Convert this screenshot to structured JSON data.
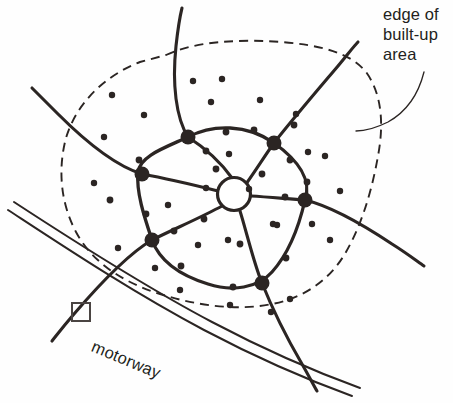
{
  "figure": {
    "type": "map-diagram",
    "background_color": "#fefefe",
    "ink_color": "#2b2523"
  },
  "labels": {
    "edge_of_builtup_area": {
      "name": "edge-of-built-up-area-label",
      "lines": [
        "edge of",
        "built-up",
        "area"
      ],
      "text": "edge of\nbuilt-up\narea",
      "x": 383,
      "y": 5,
      "font_size_px": 16.5,
      "leader_line": "curve from label down-left to the dashed boundary"
    },
    "motorway": {
      "name": "motorway-label",
      "text": "motorway",
      "x": 96,
      "y": 337,
      "rotation_deg": 22.5,
      "font_size_px": 16.5
    }
  },
  "features": {
    "built_up_area_boundary": {
      "name": "built-up-area-boundary",
      "style": "dashed",
      "dash_pattern": "9 6",
      "stroke_width": 1.9,
      "closed": true
    },
    "town_centre": {
      "name": "town-centre-ring",
      "shape": "circle",
      "cx": 234,
      "cy": 194,
      "r": 16.5,
      "fill": "#ffffff",
      "stroke_width": 3.2
    },
    "motorway": {
      "name": "motorway-road",
      "style": "double-line",
      "lines": 2,
      "stroke_width": 2.0,
      "separation_px": 9
    },
    "inner_ring_road": {
      "name": "inner-ring-road",
      "stroke_width": 3.3,
      "junction_count": 6
    },
    "radial_roads": {
      "name": "radial-roads",
      "count": 6,
      "stroke_width": 3.1
    },
    "symbol_square": {
      "name": "map-symbol-square",
      "x": 72,
      "y": 303,
      "size": 18,
      "stroke_width": 2.0
    }
  },
  "geometry": {
    "boundary_path": "M 166 55 C 196 41, 240 39, 282 42 C 318 45, 350 52, 366 72 C 382 94, 384 124, 378 156 C 372 190, 362 224, 346 252 C 330 280, 304 298, 272 304 C 238 311, 198 306, 160 294 C 122 282, 92 262, 76 232 C 60 202, 58 168, 66 138 C 76 104, 104 76, 140 62 Z",
    "ring_road_path": "M 188 137 C 213 124, 247 124, 274 143 C 298 160, 312 180, 305 200 C 300 222, 290 252, 272 272 C 258 288, 232 292, 208 284 C 182 276, 160 262, 152 240 C 144 216, 136 192, 138 172 C 140 156, 164 148, 188 137 Z",
    "junctions": [
      {
        "name": "junction-north",
        "cx": 188,
        "cy": 137,
        "r": 7.5
      },
      {
        "name": "junction-northeast",
        "cx": 274,
        "cy": 143,
        "r": 7.5
      },
      {
        "name": "junction-east",
        "cx": 305,
        "cy": 200,
        "r": 7.5
      },
      {
        "name": "junction-south",
        "cx": 262,
        "cy": 283,
        "r": 7.5
      },
      {
        "name": "junction-southwest",
        "cx": 152,
        "cy": 240,
        "r": 7.5
      },
      {
        "name": "junction-west",
        "cx": 142,
        "cy": 174,
        "r": 7.5
      }
    ],
    "radials": [
      {
        "name": "radial-north",
        "path": "M 232 178 C 222 164, 205 148, 188 137 C 176 118, 172 84, 176 46 C 178 28, 180 16, 182 8"
      },
      {
        "name": "radial-northeast",
        "path": "M 246 184 C 256 170, 266 154, 274 143 C 292 120, 316 92, 338 66 C 348 54, 354 46, 358 42"
      },
      {
        "name": "radial-east",
        "path": "M 251 196 C 268 197, 290 199, 305 200 C 330 206, 362 224, 392 244 C 408 254, 418 262, 424 266"
      },
      {
        "name": "radial-south",
        "path": "M 240 211 C 246 230, 254 264, 262 283 C 272 308, 288 340, 302 364 C 310 378, 314 386, 317 391"
      },
      {
        "name": "radial-southwest",
        "path": "M 222 206 C 204 216, 172 230, 152 240 C 128 254, 98 286, 74 314 C 62 328, 56 336, 52 341"
      },
      {
        "name": "radial-west",
        "path": "M 218 191 C 198 186, 164 178, 142 174 C 116 166, 84 140, 58 114 C 44 100, 36 92, 32 88"
      }
    ],
    "motorway_outer": "M 8 210 C 60 244, 132 292, 204 330 C 276 368, 330 388, 352 396",
    "motorway_inner": "M 14 202 C 66 236, 140 284, 212 322 C 284 360, 338 380, 360 388",
    "leader_path": "M 424 72 C 418 96, 406 112, 388 122 C 374 129, 364 131, 356 131",
    "road_nodes": [
      {
        "cx": 206,
        "cy": 151,
        "r": 3.4
      },
      {
        "cx": 226,
        "cy": 132,
        "r": 3.4
      },
      {
        "cx": 254,
        "cy": 130,
        "r": 3.4
      },
      {
        "cx": 290,
        "cy": 160,
        "r": 3.4
      },
      {
        "cx": 307,
        "cy": 182,
        "r": 3.4
      },
      {
        "cx": 286,
        "cy": 258,
        "r": 3.4
      },
      {
        "cx": 233,
        "cy": 287,
        "r": 3.4
      },
      {
        "cx": 181,
        "cy": 266,
        "r": 3.4
      },
      {
        "cx": 146,
        "cy": 214,
        "r": 3.4
      },
      {
        "cx": 139,
        "cy": 160,
        "r": 3.4
      },
      {
        "cx": 262,
        "cy": 174,
        "r": 3.4
      },
      {
        "cx": 216,
        "cy": 169,
        "r": 3.4
      },
      {
        "cx": 204,
        "cy": 219,
        "r": 3.4
      },
      {
        "cx": 174,
        "cy": 231,
        "r": 3.4
      },
      {
        "cx": 285,
        "cy": 197,
        "r": 3.4
      },
      {
        "cx": 240,
        "cy": 244,
        "r": 3.4
      },
      {
        "cx": 294,
        "cy": 125,
        "r": 3.4
      },
      {
        "cx": 110,
        "cy": 200,
        "r": 3.4
      }
    ],
    "settlement_dots": [
      {
        "cx": 112,
        "cy": 95,
        "r": 3.2
      },
      {
        "cx": 144,
        "cy": 115,
        "r": 3.2
      },
      {
        "cx": 104,
        "cy": 137,
        "r": 3.2
      },
      {
        "cx": 94,
        "cy": 183,
        "r": 3.2
      },
      {
        "cx": 193,
        "cy": 81,
        "r": 3.2
      },
      {
        "cx": 222,
        "cy": 79,
        "r": 3.2
      },
      {
        "cx": 260,
        "cy": 100,
        "r": 3.2
      },
      {
        "cx": 211,
        "cy": 102,
        "r": 3.2
      },
      {
        "cx": 296,
        "cy": 114,
        "r": 3.2
      },
      {
        "cx": 308,
        "cy": 152,
        "r": 3.2
      },
      {
        "cx": 325,
        "cy": 156,
        "r": 3.2
      },
      {
        "cx": 330,
        "cy": 240,
        "r": 3.2
      },
      {
        "cx": 312,
        "cy": 224,
        "r": 3.2
      },
      {
        "cx": 277,
        "cy": 225,
        "r": 3.2
      },
      {
        "cx": 273,
        "cy": 224,
        "r": 3.2
      },
      {
        "cx": 229,
        "cy": 154,
        "r": 3.2
      },
      {
        "cx": 168,
        "cy": 205,
        "r": 3.2
      },
      {
        "cx": 198,
        "cy": 245,
        "r": 3.2
      },
      {
        "cx": 228,
        "cy": 240,
        "r": 3.2
      },
      {
        "cx": 155,
        "cy": 268,
        "r": 3.2
      },
      {
        "cx": 180,
        "cy": 290,
        "r": 3.2
      },
      {
        "cx": 230,
        "cy": 305,
        "r": 3.2
      },
      {
        "cx": 290,
        "cy": 299,
        "r": 3.2
      },
      {
        "cx": 118,
        "cy": 248,
        "r": 3.2
      },
      {
        "cx": 249,
        "cy": 189,
        "r": 3.2
      },
      {
        "cx": 271,
        "cy": 312,
        "r": 3.2
      },
      {
        "cx": 206,
        "cy": 188,
        "r": 3.2
      },
      {
        "cx": 340,
        "cy": 191,
        "r": 3.2
      }
    ]
  }
}
